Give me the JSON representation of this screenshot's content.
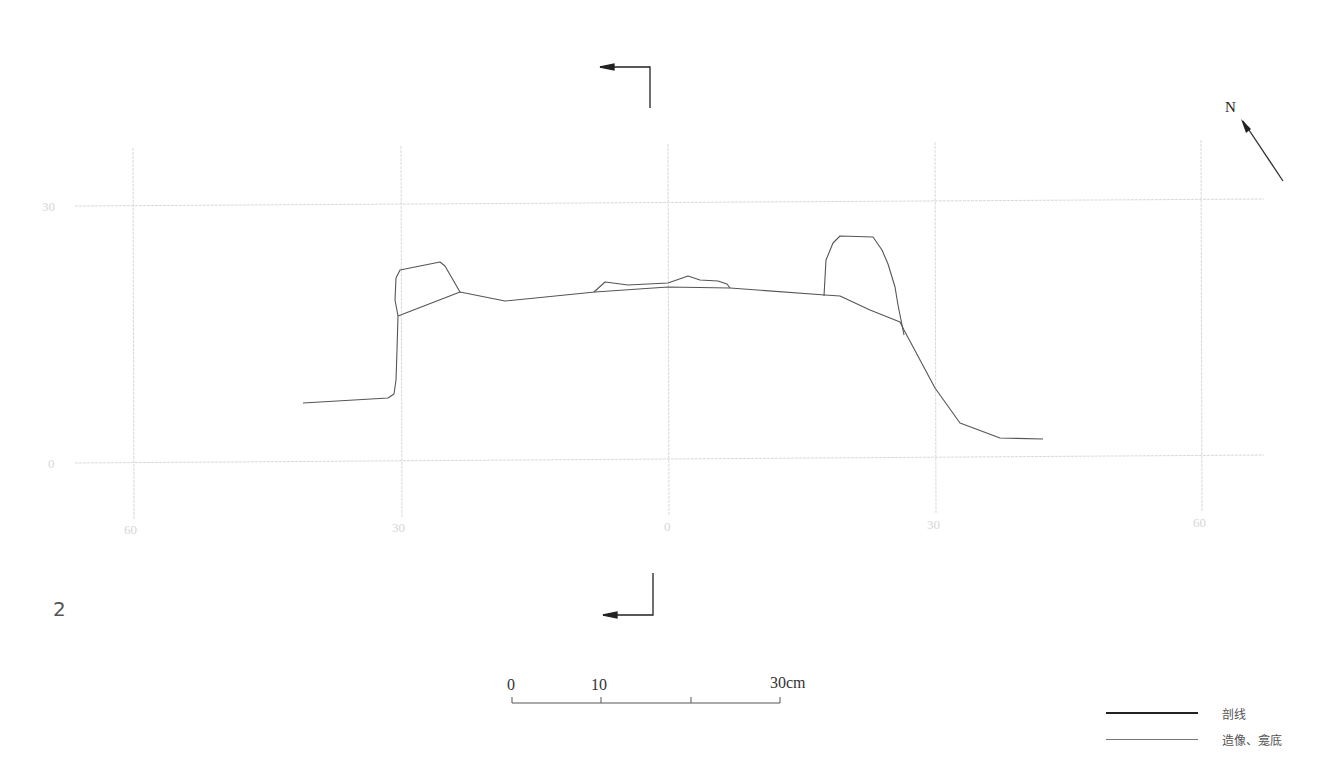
{
  "figure": {
    "number": "2",
    "grid": {
      "y_labels": [
        "30",
        "0"
      ],
      "x_labels": [
        "60",
        "30",
        "0",
        "30",
        "60"
      ]
    },
    "north": {
      "label": "N",
      "icon": "north-arrow-icon"
    },
    "section_marks": {
      "icon": "section-cut-arrow-icon",
      "count": 2
    },
    "scale_bar": {
      "labels": [
        "0",
        "10",
        "30cm"
      ],
      "ticks": [
        0,
        10,
        20,
        30
      ],
      "unit": "cm"
    },
    "legend": [
      {
        "label": "剖线",
        "style": "thick",
        "color": "#222222"
      },
      {
        "label": "造像、龛底",
        "style": "thin",
        "color": "#777777"
      }
    ],
    "colors": {
      "grid": "#d9d9d9",
      "profile": "#555555",
      "marks": "#222222"
    }
  }
}
